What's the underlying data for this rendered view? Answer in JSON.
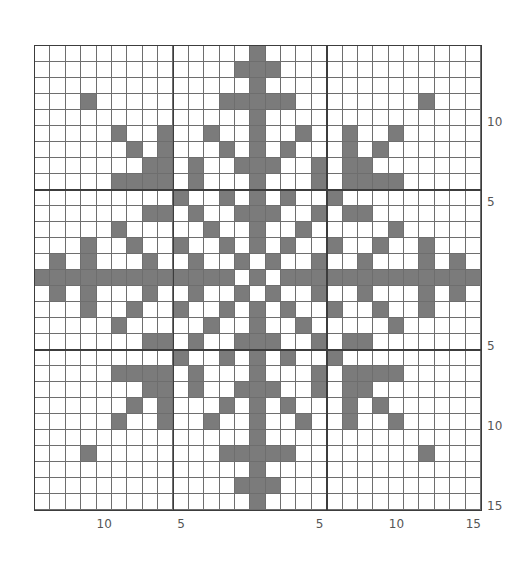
{
  "chart_data": {
    "type": "heatmap",
    "title": "",
    "grid": {
      "columns": 29,
      "rows": 29,
      "center_column": 14,
      "center_row": 14,
      "major_lines_every_from_center": 5
    },
    "fill_color": "#7b7b7b",
    "line_color": "#6e6e6e",
    "major_line_color": "#3c3c3c",
    "background_color": "#ffffff",
    "filled_cells_by_row": [
      [
        14
      ],
      [
        13,
        14,
        15
      ],
      [
        14
      ],
      [
        3,
        12,
        13,
        14,
        15,
        16,
        25
      ],
      [
        14
      ],
      [
        5,
        8,
        11,
        14,
        17,
        20,
        23
      ],
      [
        6,
        8,
        12,
        14,
        16,
        20,
        22
      ],
      [
        7,
        8,
        10,
        13,
        14,
        15,
        18,
        20,
        21
      ],
      [
        5,
        6,
        7,
        8,
        10,
        14,
        18,
        20,
        21,
        22,
        23
      ],
      [
        9,
        12,
        14,
        16,
        19
      ],
      [
        7,
        8,
        10,
        13,
        14,
        15,
        18,
        20,
        21
      ],
      [
        5,
        11,
        14,
        17,
        23
      ],
      [
        3,
        6,
        9,
        12,
        14,
        16,
        19,
        22,
        25
      ],
      [
        1,
        3,
        7,
        10,
        13,
        15,
        18,
        21,
        25,
        27
      ],
      [
        0,
        1,
        2,
        3,
        4,
        5,
        6,
        7,
        8,
        9,
        10,
        11,
        12,
        14,
        16,
        17,
        18,
        19,
        20,
        21,
        22,
        23,
        24,
        25,
        26,
        27,
        28
      ],
      [
        1,
        3,
        7,
        10,
        13,
        15,
        18,
        21,
        25,
        27
      ],
      [
        3,
        6,
        9,
        12,
        14,
        16,
        19,
        22,
        25
      ],
      [
        5,
        11,
        14,
        17,
        23
      ],
      [
        7,
        8,
        10,
        13,
        14,
        15,
        18,
        20,
        21
      ],
      [
        9,
        12,
        14,
        16,
        19
      ],
      [
        5,
        6,
        7,
        8,
        10,
        14,
        18,
        20,
        21,
        22,
        23
      ],
      [
        7,
        8,
        10,
        13,
        14,
        15,
        18,
        20,
        21
      ],
      [
        6,
        8,
        12,
        14,
        16,
        20,
        22
      ],
      [
        5,
        8,
        11,
        14,
        17,
        20,
        23
      ],
      [
        14
      ],
      [
        3,
        12,
        13,
        14,
        15,
        16,
        25
      ],
      [
        14
      ],
      [
        13,
        14,
        15
      ],
      [
        14
      ]
    ],
    "x_tick_labels": [
      {
        "text": "10",
        "column": 4
      },
      {
        "text": "5",
        "column": 9
      },
      {
        "text": "5",
        "column": 18
      },
      {
        "text": "10",
        "column": 23
      },
      {
        "text": "15",
        "column": 28
      }
    ],
    "y_tick_labels": [
      {
        "text": "10",
        "row": 4
      },
      {
        "text": "5",
        "row": 9
      },
      {
        "text": "5",
        "row": 18
      },
      {
        "text": "10",
        "row": 23
      },
      {
        "text": "15",
        "row": 28
      }
    ],
    "xlabel": "",
    "ylabel": "",
    "legend": null,
    "grid_on": true
  }
}
